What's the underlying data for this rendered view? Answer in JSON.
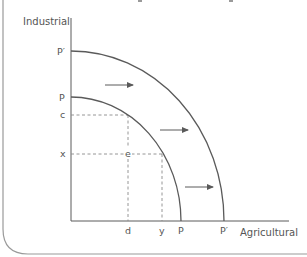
{
  "diagram": {
    "type": "production-possibility-frontier-shift",
    "axes": {
      "y_label": "Industrial",
      "x_label": "Agricultural"
    },
    "y_ticks": [
      {
        "label": "P′",
        "y": 51
      },
      {
        "label": "P",
        "y": 97
      },
      {
        "label": "c",
        "y": 115
      },
      {
        "label": "x",
        "y": 154
      }
    ],
    "x_ticks": [
      {
        "label": "d",
        "x": 128
      },
      {
        "label": "y",
        "x": 162
      },
      {
        "label": "P",
        "x": 181
      },
      {
        "label": "P′",
        "x": 224
      }
    ],
    "point_label": "e",
    "curves": [
      {
        "name": "P",
        "description": "original frontier"
      },
      {
        "name": "P′",
        "description": "shifted outward frontier"
      }
    ],
    "arrows": [
      {
        "direction": "right",
        "meaning": "outward shift"
      },
      {
        "direction": "right",
        "meaning": "outward shift"
      },
      {
        "direction": "right",
        "meaning": "outward shift"
      }
    ],
    "colors": {
      "line": "#5a5a5a",
      "dashed": "#8a8a8a",
      "frame": "#9a9a9a",
      "text": "#555555"
    }
  }
}
